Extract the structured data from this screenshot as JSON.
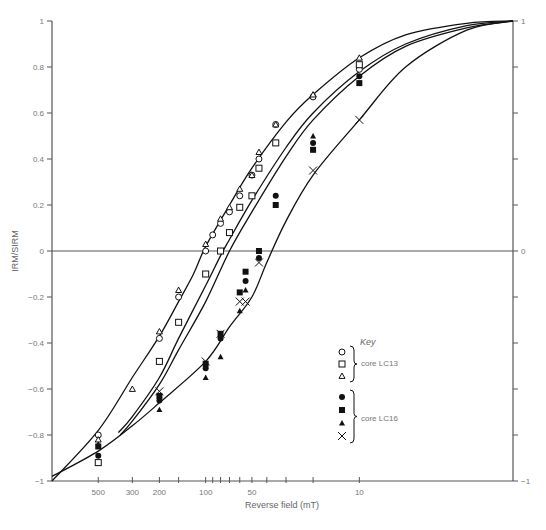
{
  "chart_data": {
    "type": "scatter",
    "title": "",
    "xlabel": "Reverse field (mT)",
    "ylabel": "IRM/SIRM",
    "x_scale": "log",
    "x_reversed": true,
    "xlim": [
      1000,
      1
    ],
    "ylim": [
      -1,
      1
    ],
    "grid": false,
    "zero_line": true,
    "x_ticks": [
      {
        "value": 500,
        "label": "500"
      },
      {
        "value": 300,
        "label": "300"
      },
      {
        "value": 200,
        "label": "200"
      },
      {
        "value": 150,
        "label": ""
      },
      {
        "value": 100,
        "label": "100"
      },
      {
        "value": 90,
        "label": ""
      },
      {
        "value": 80,
        "label": ""
      },
      {
        "value": 70,
        "label": ""
      },
      {
        "value": 60,
        "label": ""
      },
      {
        "value": 50,
        "label": "50"
      },
      {
        "value": 40,
        "label": ""
      },
      {
        "value": 30,
        "label": ""
      },
      {
        "value": 20,
        "label": ""
      },
      {
        "value": 10,
        "label": "10"
      }
    ],
    "y_ticks_left": [
      {
        "value": 1,
        "label": "1"
      },
      {
        "value": 0.8,
        "label": "0.8"
      },
      {
        "value": 0.6,
        "label": "0.6"
      },
      {
        "value": 0.4,
        "label": "0.4"
      },
      {
        "value": 0.2,
        "label": "0.2"
      },
      {
        "value": 0,
        "label": "0"
      },
      {
        "value": -0.2,
        "label": "−0.2"
      },
      {
        "value": -0.4,
        "label": "−0.4"
      },
      {
        "value": -0.6,
        "label": "−0.6"
      },
      {
        "value": -0.8,
        "label": "−0.8"
      },
      {
        "value": -1,
        "label": "−1"
      }
    ],
    "y_ticks_right": [
      {
        "value": 1,
        "label": "1"
      },
      {
        "value": 0.8,
        "label": ""
      },
      {
        "value": 0.6,
        "label": ""
      },
      {
        "value": 0.4,
        "label": ""
      },
      {
        "value": 0.2,
        "label": ""
      },
      {
        "value": 0,
        "label": "0"
      },
      {
        "value": -0.2,
        "label": ""
      },
      {
        "value": -0.4,
        "label": ""
      },
      {
        "value": -0.6,
        "label": ""
      },
      {
        "value": -0.8,
        "label": ""
      },
      {
        "value": -1,
        "label": "−1"
      }
    ],
    "legend": {
      "title": "Key",
      "position": "lower-right",
      "groups": [
        {
          "label": "core LC13",
          "markers": [
            "open-circle",
            "open-square",
            "open-triangle"
          ]
        },
        {
          "label": "core LC16",
          "markers": [
            "filled-circle",
            "filled-square",
            "filled-triangle",
            "cross"
          ]
        }
      ]
    },
    "curves": [
      {
        "name": "envelope-upper",
        "points": [
          [
            1000,
            -1
          ],
          [
            500,
            -0.78
          ],
          [
            300,
            -0.55
          ],
          [
            200,
            -0.37
          ],
          [
            150,
            -0.22
          ],
          [
            120,
            -0.1
          ],
          [
            100,
            0.02
          ],
          [
            70,
            0.2
          ],
          [
            50,
            0.36
          ],
          [
            30,
            0.56
          ],
          [
            20,
            0.68
          ],
          [
            10,
            0.84
          ],
          [
            5,
            0.94
          ],
          [
            2,
            0.99
          ],
          [
            1,
            1
          ]
        ]
      },
      {
        "name": "model-mid-1",
        "points": [
          [
            370,
            -0.79
          ],
          [
            300,
            -0.72
          ],
          [
            200,
            -0.55
          ],
          [
            150,
            -0.38
          ],
          [
            100,
            -0.15
          ],
          [
            80,
            -0.02
          ],
          [
            70,
            0.05
          ],
          [
            50,
            0.22
          ],
          [
            30,
            0.45
          ],
          [
            20,
            0.6
          ],
          [
            10,
            0.78
          ],
          [
            5,
            0.9
          ],
          [
            2,
            0.98
          ],
          [
            1,
            1
          ]
        ]
      },
      {
        "name": "model-mid-2",
        "points": [
          [
            360,
            -0.8
          ],
          [
            300,
            -0.74
          ],
          [
            200,
            -0.58
          ],
          [
            150,
            -0.43
          ],
          [
            100,
            -0.22
          ],
          [
            70,
            0.0
          ],
          [
            50,
            0.17
          ],
          [
            30,
            0.41
          ],
          [
            20,
            0.57
          ],
          [
            10,
            0.76
          ],
          [
            5,
            0.89
          ],
          [
            2,
            0.97
          ],
          [
            1,
            1
          ]
        ]
      },
      {
        "name": "envelope-lower",
        "points": [
          [
            1000,
            -0.98
          ],
          [
            500,
            -0.87
          ],
          [
            300,
            -0.76
          ],
          [
            200,
            -0.66
          ],
          [
            100,
            -0.48
          ],
          [
            70,
            -0.33
          ],
          [
            50,
            -0.2
          ],
          [
            40,
            -0.05
          ],
          [
            30,
            0.13
          ],
          [
            20,
            0.33
          ],
          [
            10,
            0.57
          ],
          [
            5,
            0.8
          ],
          [
            2,
            0.96
          ],
          [
            1,
            1
          ]
        ]
      }
    ],
    "series": [
      {
        "name": "core LC13",
        "marker": "open-circle",
        "points": [
          [
            500,
            -0.8
          ],
          [
            200,
            -0.38
          ],
          [
            150,
            -0.2
          ],
          [
            100,
            0.0
          ],
          [
            90,
            0.07
          ],
          [
            80,
            0.12
          ],
          [
            70,
            0.17
          ],
          [
            60,
            0.24
          ],
          [
            50,
            0.33
          ],
          [
            45,
            0.4
          ],
          [
            35,
            0.55
          ],
          [
            20,
            0.67
          ],
          [
            10,
            0.79
          ]
        ]
      },
      {
        "name": "core LC13",
        "marker": "open-square",
        "points": [
          [
            500,
            -0.92
          ],
          [
            200,
            -0.48
          ],
          [
            150,
            -0.31
          ],
          [
            100,
            -0.1
          ],
          [
            80,
            0.0
          ],
          [
            70,
            0.08
          ],
          [
            60,
            0.19
          ],
          [
            50,
            0.24
          ],
          [
            45,
            0.36
          ],
          [
            35,
            0.47
          ],
          [
            10,
            0.81
          ]
        ]
      },
      {
        "name": "core LC13",
        "marker": "open-triangle",
        "points": [
          [
            500,
            -0.82
          ],
          [
            300,
            -0.6
          ],
          [
            200,
            -0.35
          ],
          [
            150,
            -0.17
          ],
          [
            100,
            0.03
          ],
          [
            80,
            0.14
          ],
          [
            70,
            0.19
          ],
          [
            60,
            0.27
          ],
          [
            50,
            0.33
          ],
          [
            45,
            0.43
          ],
          [
            35,
            0.55
          ],
          [
            20,
            0.68
          ],
          [
            10,
            0.84
          ]
        ]
      },
      {
        "name": "core LC16",
        "marker": "filled-circle",
        "points": [
          [
            500,
            -0.89
          ],
          [
            200,
            -0.65
          ],
          [
            100,
            -0.51
          ],
          [
            80,
            -0.38
          ],
          [
            55,
            -0.13
          ],
          [
            45,
            -0.03
          ],
          [
            35,
            0.24
          ],
          [
            20,
            0.47
          ],
          [
            10,
            0.76
          ]
        ]
      },
      {
        "name": "core LC16",
        "marker": "filled-square",
        "points": [
          [
            500,
            -0.85
          ],
          [
            200,
            -0.63
          ],
          [
            100,
            -0.49
          ],
          [
            80,
            -0.36
          ],
          [
            60,
            -0.18
          ],
          [
            55,
            -0.09
          ],
          [
            45,
            0.0
          ],
          [
            35,
            0.2
          ],
          [
            20,
            0.44
          ],
          [
            10,
            0.73
          ]
        ]
      },
      {
        "name": "core LC16",
        "marker": "filled-triangle",
        "points": [
          [
            500,
            -0.84
          ],
          [
            200,
            -0.69
          ],
          [
            100,
            -0.55
          ],
          [
            80,
            -0.46
          ],
          [
            60,
            -0.26
          ],
          [
            55,
            -0.17
          ],
          [
            20,
            0.5
          ]
        ]
      },
      {
        "name": "core LC16",
        "marker": "cross",
        "points": [
          [
            200,
            -0.61
          ],
          [
            100,
            -0.48
          ],
          [
            80,
            -0.36
          ],
          [
            60,
            -0.22
          ],
          [
            55,
            -0.22
          ],
          [
            45,
            -0.05
          ],
          [
            20,
            0.35
          ],
          [
            10,
            0.57
          ]
        ]
      }
    ]
  }
}
